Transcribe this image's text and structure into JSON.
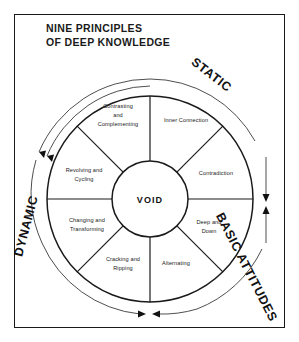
{
  "document": {
    "title": "NINE PRINCIPLES\nOF DEEP KNOWLEDGE"
  },
  "diagram": {
    "center_label": "VOID",
    "segments": [
      {
        "id": "inner-connection",
        "label": "Inner Connection",
        "lines": [
          "Inner Connection"
        ]
      },
      {
        "id": "contradiction",
        "label": "Contradiction",
        "lines": [
          "Contradiction"
        ]
      },
      {
        "id": "deep-and-down",
        "label": "Deep and Down",
        "lines": [
          "Deep and",
          "Down"
        ]
      },
      {
        "id": "alternating",
        "label": "Alternating",
        "lines": [
          "Alternating"
        ]
      },
      {
        "id": "cracking-and-ripping",
        "label": "Cracking and Ripping",
        "lines": [
          "Cracking and",
          "Ripping"
        ]
      },
      {
        "id": "changing-and-transforming",
        "label": "Changing and Transforming",
        "lines": [
          "Changing and",
          "Transforming"
        ]
      },
      {
        "id": "revolving-and-cycling",
        "label": "Revolving and Cycling",
        "lines": [
          "Revolving and",
          "Cycling"
        ]
      },
      {
        "id": "contrasting-and-complementing",
        "label": "Contrasting and Complementing",
        "lines": [
          "Contrasting",
          "and",
          "Complementing"
        ]
      }
    ],
    "axis_labels": [
      {
        "id": "static",
        "label": "STATIC"
      },
      {
        "id": "dynamic",
        "label": "DYNAMIC"
      },
      {
        "id": "basic-attitudes",
        "label": "BASIC ATTITUDES"
      }
    ],
    "colors": {
      "stroke": "#1a1a1a",
      "background": "#ffffff",
      "arrow": "#3a3a3a"
    }
  }
}
